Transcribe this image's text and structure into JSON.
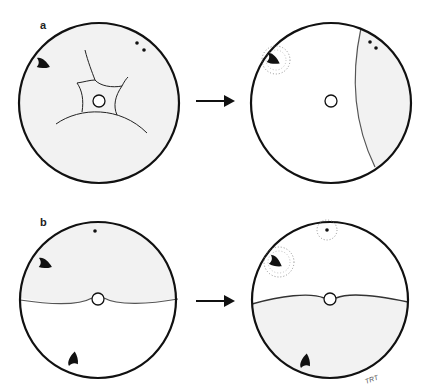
{
  "figure": {
    "panels": [
      {
        "label": "a",
        "before": {
          "description": "Whole disc lightly shaded; star-shaped web of lines around central open circle; dark arrowhead upper-left; two dots upper-right",
          "fill_shaded": "#f2f2f2"
        },
        "after": {
          "description": "Disc mostly white; shaded crescent on right side bounded by curved line; dark arrowhead upper-left surrounded by dotted halo; two dots upper-right within shaded zone",
          "fill_shaded": "#f2f2f2"
        }
      },
      {
        "label": "b",
        "before": {
          "description": "Upper half shaded with dot and dark arrowhead; lower half white with arrowhead near bottom; horizontal wavy divider through central open circle",
          "fill_shaded": "#f2f2f2"
        },
        "after": {
          "description": "Upper half white with dot and arrowhead each surrounded by dotted halos; lower half shaded with arrowhead near bottom; horizontal wavy divider through central open circle",
          "fill_shaded": "#f2f2f2"
        }
      }
    ],
    "arrow_symbol": "right-arrow",
    "signature": "TRT"
  },
  "colors": {
    "stroke": "#111111",
    "shade": "#f1f1f1",
    "divider": "#555555",
    "background": "#ffffff"
  }
}
